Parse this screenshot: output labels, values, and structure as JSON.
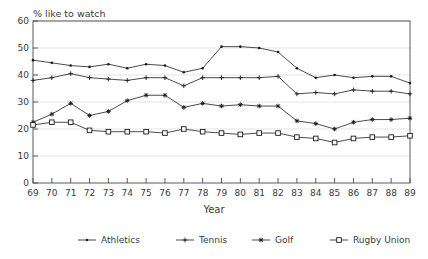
{
  "chart_data": {
    "type": "line",
    "title": "",
    "ylabel": "% like to watch",
    "xlabel": "Year",
    "xlim": [
      69,
      89
    ],
    "ylim": [
      0,
      60
    ],
    "ytick_step": 10,
    "grid": true,
    "legend_position": "bottom",
    "x": [
      69,
      70,
      71,
      72,
      73,
      74,
      75,
      76,
      77,
      78,
      79,
      80,
      81,
      82,
      83,
      84,
      85,
      86,
      87,
      88,
      89
    ],
    "xticklabels": [
      "69",
      "70",
      "71",
      "72",
      "73",
      "74",
      "75",
      "76",
      "77",
      "78",
      "79",
      "80",
      "81",
      "82",
      "83",
      "84",
      "85",
      "86",
      "87",
      "88",
      "89"
    ],
    "yticklabels": [
      "0",
      "10",
      "20",
      "30",
      "40",
      "50",
      "60"
    ],
    "yticks": [
      0,
      10,
      20,
      30,
      40,
      50,
      60
    ],
    "series": [
      {
        "name": "Athletics",
        "marker": "dot",
        "values": [
          45.5,
          44.5,
          43.5,
          43.0,
          44.0,
          42.5,
          44.0,
          43.5,
          41.0,
          42.5,
          50.5,
          50.5,
          50.0,
          48.5,
          42.5,
          39.0,
          40.0,
          39.0,
          39.5,
          39.5,
          37.0
        ]
      },
      {
        "name": "Tennis",
        "marker": "plus",
        "values": [
          38.0,
          39.0,
          40.5,
          39.0,
          38.5,
          38.0,
          39.0,
          39.0,
          36.0,
          39.0,
          39.0,
          39.0,
          39.0,
          39.5,
          33.0,
          33.5,
          33.0,
          34.5,
          34.0,
          34.0,
          33.0
        ]
      },
      {
        "name": "Golf",
        "marker": "star",
        "values": [
          22.5,
          25.5,
          29.5,
          25.0,
          26.5,
          30.5,
          32.5,
          32.5,
          28.0,
          29.5,
          28.5,
          29.0,
          28.5,
          28.5,
          23.0,
          22.0,
          20.0,
          22.5,
          23.5,
          23.5,
          24.0
        ]
      },
      {
        "name": "Rugby Union",
        "marker": "square",
        "values": [
          21.5,
          22.5,
          22.5,
          19.5,
          19.0,
          19.0,
          19.0,
          18.5,
          20.0,
          19.0,
          18.5,
          18.0,
          18.5,
          18.5,
          17.0,
          16.5,
          15.0,
          16.5,
          17.0,
          17.0,
          17.5
        ]
      }
    ]
  },
  "legend": {
    "items": [
      {
        "label": "Athletics"
      },
      {
        "label": "Tennis"
      },
      {
        "label": "Golf"
      },
      {
        "label": "Rugby Union"
      }
    ]
  }
}
